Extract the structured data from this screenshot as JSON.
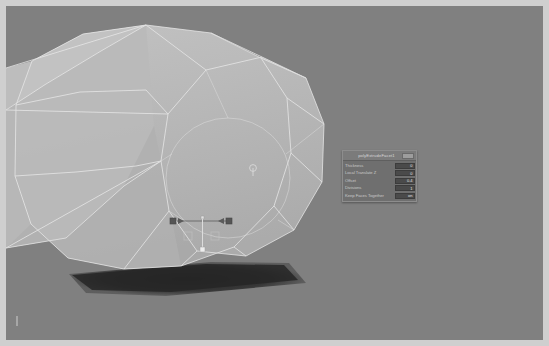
{
  "window": {
    "title": "3D Viewport"
  },
  "viewport": {
    "name": "perspective-viewport",
    "background_color": "#808080",
    "mesh": {
      "name": "polygon-cylinder-mesh",
      "shading": "smooth-shaded-wireframe",
      "fill_color": "#b6b6b6",
      "wire_color": "#e8e8e8",
      "selected": true
    },
    "shadow": {
      "name": "ground-shadow",
      "color": "#2b2b2b"
    },
    "manipulator": {
      "name": "translate-manipulator",
      "axis_handle_color": "#5a5a5a",
      "center_handle_color": "#dadada"
    },
    "pivot_marker": {
      "name": "pivot-marker",
      "color": "#d8d8d8"
    }
  },
  "panel": {
    "name": "poly-extrude-facet-panel",
    "title": "polyExtrudeFacet1",
    "menu_button_label": "",
    "rows": [
      {
        "label": "Thickness",
        "value": "0"
      },
      {
        "label": "Local Translate Z",
        "value": "0"
      },
      {
        "label": "Offset",
        "value": "0.4"
      },
      {
        "label": "Divisions",
        "value": "1"
      },
      {
        "label": "Keep Faces Together",
        "value": "on"
      }
    ]
  },
  "colors": {
    "panel_bg": "#6f6f6f",
    "panel_titlebar": "#7b7b7b",
    "field_bg": "#4a4a4a",
    "label_text": "#cacaca",
    "frame": "#cfcfcf"
  }
}
